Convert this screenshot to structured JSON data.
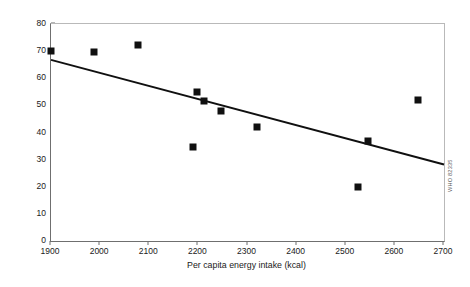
{
  "chart_data": {
    "type": "scatter",
    "title": "",
    "xlabel": "Per capita energy intake (kcal)",
    "ylabel": "Percentage of children underweight",
    "xlim": [
      1900,
      2700
    ],
    "ylim": [
      0,
      80
    ],
    "xticks": [
      1900,
      2000,
      2100,
      2200,
      2300,
      2400,
      2500,
      2600,
      2700
    ],
    "yticks": [
      0,
      10,
      20,
      30,
      40,
      50,
      60,
      70,
      80
    ],
    "grid": false,
    "legend": null,
    "marker_style": "filled-square",
    "marker_color": "#101010",
    "points": [
      {
        "x": 1900,
        "y": 70.2
      },
      {
        "x": 1988,
        "y": 69.6
      },
      {
        "x": 2078,
        "y": 72.4
      },
      {
        "x": 2190,
        "y": 34.6
      },
      {
        "x": 2197,
        "y": 55.1
      },
      {
        "x": 2211,
        "y": 51.6
      },
      {
        "x": 2247,
        "y": 47.8
      },
      {
        "x": 2320,
        "y": 42.0
      },
      {
        "x": 2524,
        "y": 20.0
      },
      {
        "x": 2545,
        "y": 37.0
      },
      {
        "x": 2648,
        "y": 52.1
      }
    ],
    "trendline": {
      "type": "linear-fit",
      "x_start": 1900,
      "y_start": 66.8,
      "x_end": 2700,
      "y_end": 28.2,
      "color": "#101010"
    }
  },
  "annotations": {
    "watermark": "WHO 82335"
  }
}
